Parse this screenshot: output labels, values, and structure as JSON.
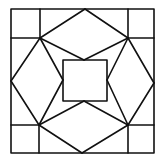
{
  "diagram": {
    "type": "quilt-block-pattern",
    "stroke_color": "#111111",
    "background": "#ffffff",
    "stroke_width": 1.6,
    "outer_square": {
      "x1": 11,
      "y1": 9,
      "x2": 154,
      "y2": 153
    },
    "inner_square": {
      "x1": 63,
      "y1": 60,
      "x2": 107,
      "y2": 101
    },
    "corner_points": {
      "top_left": [
        40,
        38
      ],
      "top_right": [
        128,
        38
      ],
      "bottom_left": [
        39,
        125
      ],
      "bottom_right": [
        128,
        125
      ]
    },
    "edge_midpoints": {
      "top": [
        85,
        9
      ],
      "bottom": [
        82,
        153
      ],
      "left": [
        11,
        81
      ],
      "right": [
        154,
        83
      ]
    },
    "inner_midpoints": {
      "top": [
        84,
        60
      ],
      "bottom": [
        84,
        101
      ],
      "left": [
        63,
        80
      ],
      "right": [
        107,
        80
      ]
    }
  }
}
